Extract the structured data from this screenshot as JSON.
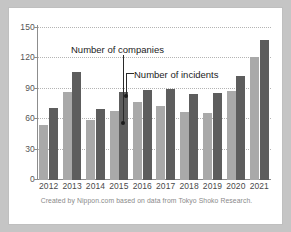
{
  "caption": "Created by Nippon.com based on data from Tokyo Shoko Research.",
  "annotations": {
    "companies": "Number of companies",
    "incidents": "Number of incidents"
  },
  "colors": {
    "series_companies": "#a9a9a9",
    "series_incidents": "#5d5d5d",
    "frame": "#c5c5c5",
    "card": "#ffffff",
    "grid": "#b4b4b4",
    "axis": "#8d8d8d",
    "caption_text": "#8a8a8a"
  },
  "chart_data": {
    "type": "bar",
    "title": "",
    "xlabel": "",
    "ylabel": "",
    "ylim": [
      0,
      150
    ],
    "yticks": [
      0,
      30,
      60,
      90,
      120,
      150
    ],
    "grid": true,
    "legend_position": "inline-annotations",
    "categories": [
      "2012",
      "2013",
      "2014",
      "2015",
      "2016",
      "2017",
      "2018",
      "2019",
      "2020",
      "2021"
    ],
    "series": [
      {
        "name": "Number of companies",
        "color": "#a9a9a9",
        "values": [
          54,
          87,
          59,
          68,
          77,
          73,
          67,
          66,
          88,
          121
        ]
      },
      {
        "name": "Number of incidents",
        "color": "#5d5d5d",
        "values": [
          71,
          107,
          70,
          87,
          89,
          90,
          85,
          86,
          103,
          138
        ]
      }
    ]
  }
}
